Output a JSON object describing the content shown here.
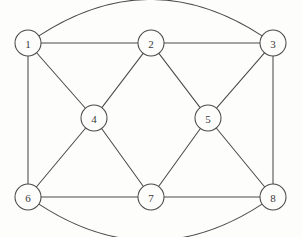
{
  "diagram": {
    "type": "undirected-graph",
    "title": "",
    "canvas": {
      "width": 302,
      "height": 237
    },
    "style": {
      "background_color": "#fdfdfc",
      "line_color": "#4a4a4a",
      "node_fill_color": "#fdfdfc",
      "node_stroke_color": "#4a4a4a",
      "label_color": "#3a3a3a",
      "node_radius": 13,
      "line_width": 1.05
    },
    "nodes": [
      {
        "id": "1",
        "label": "1",
        "x": 28,
        "y": 43
      },
      {
        "id": "2",
        "label": "2",
        "x": 151,
        "y": 43
      },
      {
        "id": "3",
        "label": "3",
        "x": 273,
        "y": 43
      },
      {
        "id": "4",
        "label": "4",
        "x": 94,
        "y": 118
      },
      {
        "id": "5",
        "label": "5",
        "x": 208,
        "y": 118
      },
      {
        "id": "6",
        "label": "6",
        "x": 28,
        "y": 197
      },
      {
        "id": "7",
        "label": "7",
        "x": 151,
        "y": 197
      },
      {
        "id": "8",
        "label": "8",
        "x": 273,
        "y": 197
      }
    ],
    "edges": [
      {
        "from": "1",
        "to": "2",
        "shape": "straight"
      },
      {
        "from": "2",
        "to": "3",
        "shape": "straight"
      },
      {
        "from": "1",
        "to": "6",
        "shape": "straight"
      },
      {
        "from": "3",
        "to": "8",
        "shape": "straight"
      },
      {
        "from": "6",
        "to": "7",
        "shape": "straight"
      },
      {
        "from": "7",
        "to": "8",
        "shape": "straight"
      },
      {
        "from": "1",
        "to": "4",
        "shape": "straight"
      },
      {
        "from": "2",
        "to": "4",
        "shape": "straight"
      },
      {
        "from": "4",
        "to": "6",
        "shape": "straight"
      },
      {
        "from": "4",
        "to": "7",
        "shape": "straight"
      },
      {
        "from": "2",
        "to": "5",
        "shape": "straight"
      },
      {
        "from": "3",
        "to": "5",
        "shape": "straight"
      },
      {
        "from": "5",
        "to": "7",
        "shape": "straight"
      },
      {
        "from": "5",
        "to": "8",
        "shape": "straight"
      },
      {
        "from": "1",
        "to": "3",
        "shape": "curved",
        "bow": -40
      },
      {
        "from": "6",
        "to": "8",
        "shape": "curved",
        "bow": 40
      }
    ]
  }
}
